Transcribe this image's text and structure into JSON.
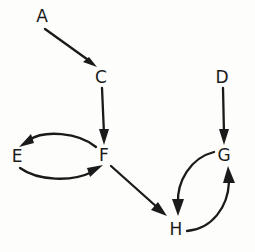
{
  "diagram": {
    "type": "directed-graph",
    "style": "hand-drawn",
    "background_color": "#fdfdfc",
    "stroke_color": "#1a1a1a",
    "canvas": {
      "width": 255,
      "height": 252
    },
    "nodes": [
      {
        "id": "A",
        "label": "A",
        "x": 42,
        "y": 16
      },
      {
        "id": "C",
        "label": "C",
        "x": 101,
        "y": 78
      },
      {
        "id": "D",
        "label": "D",
        "x": 222,
        "y": 78
      },
      {
        "id": "E",
        "label": "E",
        "x": 17,
        "y": 156
      },
      {
        "id": "F",
        "label": "F",
        "x": 104,
        "y": 155
      },
      {
        "id": "G",
        "label": "G",
        "x": 224,
        "y": 155
      },
      {
        "id": "H",
        "label": "H",
        "x": 176,
        "y": 229
      }
    ],
    "edges": [
      {
        "id": "A-C",
        "from": "A",
        "to": "C",
        "shape": "straight",
        "direction": "down-right"
      },
      {
        "id": "C-F",
        "from": "C",
        "to": "F",
        "shape": "straight",
        "direction": "down"
      },
      {
        "id": "F-E",
        "from": "F",
        "to": "E",
        "shape": "curved",
        "curve": "arc-above",
        "direction": "left"
      },
      {
        "id": "E-F",
        "from": "E",
        "to": "F",
        "shape": "curved",
        "curve": "arc-below",
        "direction": "right"
      },
      {
        "id": "F-H",
        "from": "F",
        "to": "H",
        "shape": "straight",
        "direction": "down-right"
      },
      {
        "id": "D-G",
        "from": "D",
        "to": "G",
        "shape": "straight",
        "direction": "down"
      },
      {
        "id": "G-H",
        "from": "G",
        "to": "H",
        "shape": "curved",
        "curve": "arc-left",
        "direction": "down-left"
      },
      {
        "id": "H-G",
        "from": "H",
        "to": "G",
        "shape": "curved",
        "curve": "arc-right",
        "direction": "up-right"
      }
    ]
  }
}
